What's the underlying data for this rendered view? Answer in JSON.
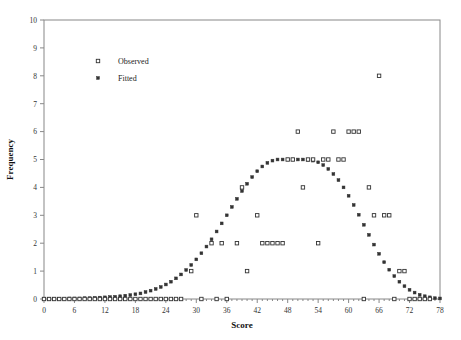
{
  "chart_data": {
    "type": "scatter",
    "title": "",
    "xlabel": "Score",
    "ylabel": "Frequency",
    "xlim": [
      0,
      78
    ],
    "ylim": [
      0,
      10
    ],
    "xticks": [
      0,
      6,
      12,
      18,
      24,
      30,
      36,
      42,
      48,
      54,
      60,
      66,
      72,
      78
    ],
    "yticks": [
      0,
      1,
      2,
      3,
      4,
      5,
      6,
      7,
      8,
      9,
      10
    ],
    "xtick_labels": [
      "0",
      "6",
      "12",
      "18",
      "24",
      "30",
      "36",
      "42",
      "48",
      "54",
      "60",
      "66",
      "72",
      "78"
    ],
    "ytick_labels": [
      "0",
      "1",
      "2",
      "3",
      "4",
      "5",
      "6",
      "7",
      "8",
      "9",
      "10"
    ],
    "x_minor_step": 1,
    "grid": false,
    "legend_position": "upper-left-inside",
    "marker_color": "#333333",
    "axis_color": "#888888",
    "series": [
      {
        "name": "Observed",
        "marker": "open-square",
        "points": [
          [
            0,
            0
          ],
          [
            1,
            0
          ],
          [
            2,
            0
          ],
          [
            3,
            0
          ],
          [
            4,
            0
          ],
          [
            5,
            0
          ],
          [
            6,
            0
          ],
          [
            7,
            0
          ],
          [
            8,
            0
          ],
          [
            9,
            0
          ],
          [
            10,
            0
          ],
          [
            11,
            0
          ],
          [
            12,
            0
          ],
          [
            13,
            0
          ],
          [
            14,
            0
          ],
          [
            15,
            0
          ],
          [
            16,
            0
          ],
          [
            17,
            0
          ],
          [
            18,
            0
          ],
          [
            19,
            0
          ],
          [
            20,
            0
          ],
          [
            21,
            0
          ],
          [
            22,
            0
          ],
          [
            23,
            0
          ],
          [
            24,
            0
          ],
          [
            25,
            0
          ],
          [
            26,
            0
          ],
          [
            27,
            0
          ],
          [
            29,
            1
          ],
          [
            30,
            3
          ],
          [
            31,
            0
          ],
          [
            33,
            2
          ],
          [
            34,
            0
          ],
          [
            35,
            2
          ],
          [
            36,
            0
          ],
          [
            38,
            2
          ],
          [
            39,
            4
          ],
          [
            40,
            1
          ],
          [
            42,
            3
          ],
          [
            43,
            2
          ],
          [
            44,
            2
          ],
          [
            45,
            2
          ],
          [
            46,
            2
          ],
          [
            47,
            2
          ],
          [
            48,
            5
          ],
          [
            49,
            5
          ],
          [
            50,
            6
          ],
          [
            51,
            4
          ],
          [
            52,
            5
          ],
          [
            53,
            5
          ],
          [
            54,
            2
          ],
          [
            55,
            5
          ],
          [
            56,
            5
          ],
          [
            57,
            6
          ],
          [
            58,
            5
          ],
          [
            59,
            5
          ],
          [
            60,
            6
          ],
          [
            61,
            6
          ],
          [
            62,
            6
          ],
          [
            63,
            0
          ],
          [
            64,
            4
          ],
          [
            65,
            3
          ],
          [
            66,
            8
          ],
          [
            67,
            3
          ],
          [
            68,
            3
          ],
          [
            69,
            0
          ],
          [
            70,
            1
          ],
          [
            71,
            1
          ],
          [
            72,
            0
          ],
          [
            73,
            0
          ],
          [
            74,
            0
          ],
          [
            75,
            0
          ],
          [
            76,
            0
          ]
        ]
      },
      {
        "name": "Fitted",
        "marker": "filled-square",
        "points": [
          [
            0,
            0.01
          ],
          [
            1,
            0.01
          ],
          [
            2,
            0.01
          ],
          [
            3,
            0.01
          ],
          [
            4,
            0.01
          ],
          [
            5,
            0.02
          ],
          [
            6,
            0.02
          ],
          [
            7,
            0.02
          ],
          [
            8,
            0.03
          ],
          [
            9,
            0.03
          ],
          [
            10,
            0.04
          ],
          [
            11,
            0.05
          ],
          [
            12,
            0.06
          ],
          [
            13,
            0.07
          ],
          [
            14,
            0.08
          ],
          [
            15,
            0.1
          ],
          [
            16,
            0.12
          ],
          [
            17,
            0.14
          ],
          [
            18,
            0.17
          ],
          [
            19,
            0.2
          ],
          [
            20,
            0.25
          ],
          [
            21,
            0.3
          ],
          [
            22,
            0.36
          ],
          [
            23,
            0.43
          ],
          [
            24,
            0.52
          ],
          [
            25,
            0.62
          ],
          [
            26,
            0.74
          ],
          [
            27,
            0.88
          ],
          [
            28,
            1.04
          ],
          [
            29,
            1.22
          ],
          [
            30,
            1.42
          ],
          [
            31,
            1.64
          ],
          [
            32,
            1.88
          ],
          [
            33,
            2.14
          ],
          [
            34,
            2.42
          ],
          [
            35,
            2.71
          ],
          [
            36,
            3.0
          ],
          [
            37,
            3.3
          ],
          [
            38,
            3.59
          ],
          [
            39,
            3.87
          ],
          [
            40,
            4.13
          ],
          [
            41,
            4.37
          ],
          [
            42,
            4.58
          ],
          [
            43,
            4.75
          ],
          [
            44,
            4.88
          ],
          [
            45,
            4.96
          ],
          [
            46,
            5.0
          ],
          [
            47,
            5.0
          ],
          [
            48,
            5.0
          ],
          [
            49,
            5.0
          ],
          [
            50,
            5.0
          ],
          [
            51,
            5.0
          ],
          [
            52,
            4.99
          ],
          [
            53,
            4.96
          ],
          [
            54,
            4.9
          ],
          [
            55,
            4.8
          ],
          [
            56,
            4.66
          ],
          [
            57,
            4.48
          ],
          [
            58,
            4.26
          ],
          [
            59,
            4.0
          ],
          [
            60,
            3.7
          ],
          [
            61,
            3.37
          ],
          [
            62,
            3.02
          ],
          [
            63,
            2.66
          ],
          [
            64,
            2.3
          ],
          [
            65,
            1.95
          ],
          [
            66,
            1.62
          ],
          [
            67,
            1.32
          ],
          [
            68,
            1.05
          ],
          [
            69,
            0.82
          ],
          [
            70,
            0.62
          ],
          [
            71,
            0.46
          ],
          [
            72,
            0.33
          ],
          [
            73,
            0.23
          ],
          [
            74,
            0.15
          ],
          [
            75,
            0.1
          ],
          [
            76,
            0.06
          ],
          [
            77,
            0.03
          ],
          [
            78,
            0.02
          ]
        ]
      }
    ],
    "legend": [
      {
        "label": "Observed",
        "marker": "open-square"
      },
      {
        "label": "Fitted",
        "marker": "filled-square"
      }
    ]
  }
}
